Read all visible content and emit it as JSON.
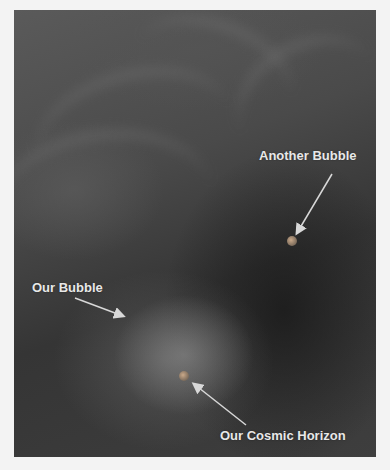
{
  "image": {
    "description": "Artistic depiction of bubble universes in a cosmic multiverse",
    "labels": {
      "another_bubble": "Another Bubble",
      "our_bubble": "Our Bubble",
      "our_cosmic_horizon": "Our Cosmic Horizon"
    },
    "colors": {
      "background": "#f3f3f3",
      "label": "#e8e8e8",
      "arrow": "#d8d8d8"
    }
  }
}
